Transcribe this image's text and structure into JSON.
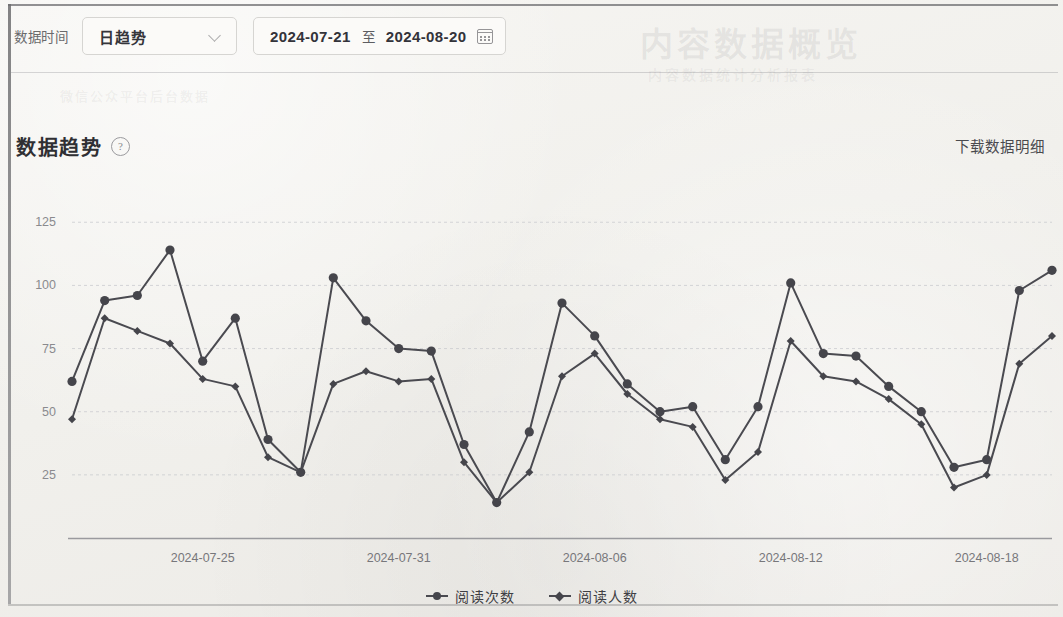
{
  "toolbar": {
    "label": "数据时间",
    "granularity_value": "日趋势",
    "granularity_options": [
      "日趋势"
    ],
    "chevron_icon": "chevron-down-icon",
    "date_start": "2024-07-21",
    "date_separator": "至",
    "date_end": "2024-08-20",
    "calendar_icon": "calendar-icon"
  },
  "section": {
    "title": "数据趋势",
    "help_icon": "question-mark-icon",
    "help_glyph": "?",
    "download_label": "下载数据明细"
  },
  "ghost": {
    "title": "内容数据概览",
    "subtitle": "内容数据统计分析报表",
    "left": "微信公众平台后台数据"
  },
  "legend": {
    "items": [
      {
        "label": "阅读次数",
        "marker": "circle"
      },
      {
        "label": "阅读人数",
        "marker": "diamond"
      }
    ]
  },
  "chart_data": {
    "type": "line",
    "title": "数据趋势",
    "xlabel": "",
    "ylabel": "",
    "ylim": [
      0,
      135
    ],
    "yticks": [
      25,
      50,
      75,
      100,
      125
    ],
    "grid": true,
    "legend_position": "bottom",
    "x": [
      "2024-07-21",
      "2024-07-22",
      "2024-07-23",
      "2024-07-24",
      "2024-07-25",
      "2024-07-26",
      "2024-07-27",
      "2024-07-28",
      "2024-07-29",
      "2024-07-30",
      "2024-07-31",
      "2024-08-01",
      "2024-08-02",
      "2024-08-03",
      "2024-08-04",
      "2024-08-05",
      "2024-08-06",
      "2024-08-07",
      "2024-08-08",
      "2024-08-09",
      "2024-08-10",
      "2024-08-11",
      "2024-08-12",
      "2024-08-13",
      "2024-08-14",
      "2024-08-15",
      "2024-08-16",
      "2024-08-17",
      "2024-08-18",
      "2024-08-19",
      "2024-08-20"
    ],
    "xtick_labels": [
      "2024-07-25",
      "2024-07-31",
      "2024-08-06",
      "2024-08-12",
      "2024-08-18"
    ],
    "xtick_indices": [
      4,
      10,
      16,
      22,
      28
    ],
    "series": [
      {
        "name": "阅读次数",
        "marker": "circle",
        "values": [
          62,
          94,
          96,
          114,
          70,
          87,
          39,
          26,
          103,
          86,
          75,
          74,
          37,
          14,
          42,
          93,
          80,
          61,
          50,
          52,
          31,
          52,
          101,
          73,
          72,
          60,
          50,
          28,
          31,
          98,
          106
        ]
      },
      {
        "name": "阅读人数",
        "marker": "diamond",
        "values": [
          47,
          87,
          82,
          77,
          63,
          60,
          32,
          26,
          61,
          66,
          62,
          63,
          30,
          14,
          26,
          64,
          73,
          57,
          47,
          44,
          23,
          34,
          78,
          64,
          62,
          55,
          45,
          20,
          25,
          69,
          80
        ]
      }
    ]
  }
}
